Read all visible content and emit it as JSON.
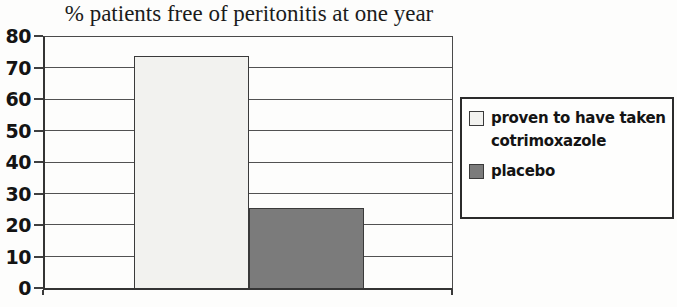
{
  "chart_data": {
    "type": "bar",
    "title": "% patients free of peritonitis at one year",
    "categories": [
      ""
    ],
    "series": [
      {
        "name": "proven to have taken cotrimoxazole",
        "values": [
          74
        ],
        "color": "#f2f2ef"
      },
      {
        "name": "placebo",
        "values": [
          25.5
        ],
        "color": "#7b7b7b"
      }
    ],
    "xlabel": "",
    "ylabel": "",
    "ylim": [
      0,
      80
    ],
    "yticks": [
      0,
      10,
      20,
      30,
      40,
      50,
      60,
      70,
      80
    ],
    "grid": true,
    "legend_position": "right"
  },
  "colors": {
    "axis": "#3a3a3a",
    "grid": "#525252",
    "text": "#141414",
    "background": "#fdfdfc",
    "legend_border": "#2b2b2b"
  }
}
